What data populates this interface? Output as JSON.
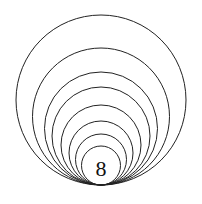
{
  "diagram": {
    "label": "8",
    "circle_count": 8,
    "tangent_point": {
      "x": 101,
      "y": 185
    },
    "circle_tops": [
      15,
      48,
      72,
      87,
      105,
      121,
      134,
      146
    ],
    "stroke": "#222222"
  }
}
